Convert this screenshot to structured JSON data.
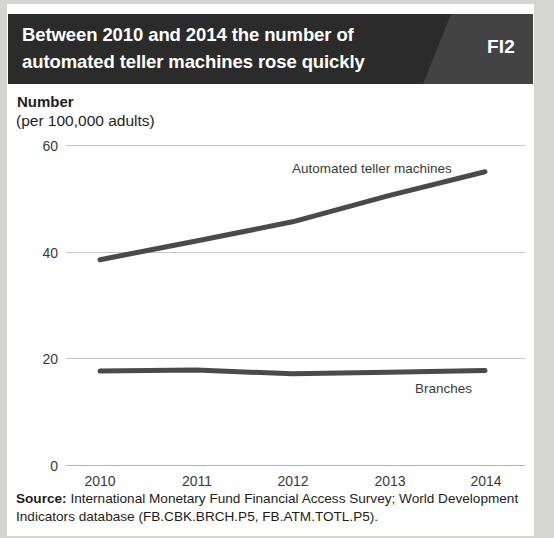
{
  "header": {
    "title_line1": "Between 2010 and 2014 the number of",
    "title_line2": "automated teller machines rose quickly",
    "badge": "FI2",
    "bar_color": "#2b2b2b",
    "badge_bg_color": "#434343"
  },
  "axis": {
    "title": "Number",
    "subtitle": "(per 100,000 adults)"
  },
  "source": {
    "label": "Source:",
    "text": " International Monetary Fund Financial Access Survey; World Development Indicators database (FB.CBK.BRCH.P5, FB.ATM.TOTL.P5)."
  },
  "chart_data": {
    "type": "line",
    "title": "Between 2010 and 2014 the number of automated teller machines rose quickly",
    "xlabel": "",
    "ylabel": "Number (per 100,000 adults)",
    "categories": [
      "2010",
      "2011",
      "2012",
      "2013",
      "2014"
    ],
    "x": [
      2010,
      2011,
      2012,
      2013,
      2014
    ],
    "ylim": [
      0,
      60
    ],
    "yticks": [
      0,
      20,
      40,
      60
    ],
    "ytick_labels": [
      "0",
      "20",
      "40",
      "60"
    ],
    "grid": true,
    "legend": "inline-labels",
    "line_color": "#4a4a4a",
    "series": [
      {
        "name": "Automated teller machines",
        "values": [
          38.5,
          42.0,
          45.6,
          50.5,
          55.0
        ]
      },
      {
        "name": "Branches",
        "values": [
          17.6,
          17.8,
          17.1,
          17.4,
          17.7
        ]
      }
    ]
  }
}
